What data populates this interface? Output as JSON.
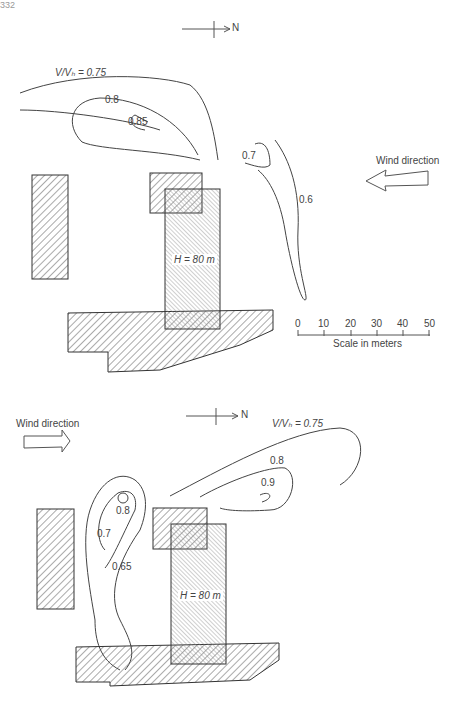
{
  "page": {
    "number": "332"
  },
  "top_figure": {
    "north_label": "N",
    "wind_label": "Wind direction",
    "wind_arrow": "left",
    "contour_labels": {
      "c075": "V/Vₕ = 0.75",
      "c08": "0.8",
      "c085": "0.85",
      "c07": "0.7",
      "c06": "0.6"
    },
    "building_label": "H = 80 m",
    "scale": {
      "ticks": [
        "0",
        "10",
        "20",
        "30",
        "40",
        "50"
      ],
      "caption": "Scale in meters"
    }
  },
  "bottom_figure": {
    "north_label": "N",
    "wind_label": "Wind direction",
    "wind_arrow": "right",
    "contour_labels": {
      "c075": "V/Vₕ = 0.75",
      "c08a": "0.8",
      "c09": "0.9",
      "c08b": "0.8",
      "c07": "0.7",
      "c065": "0.65"
    },
    "building_label": "H = 80 m"
  }
}
